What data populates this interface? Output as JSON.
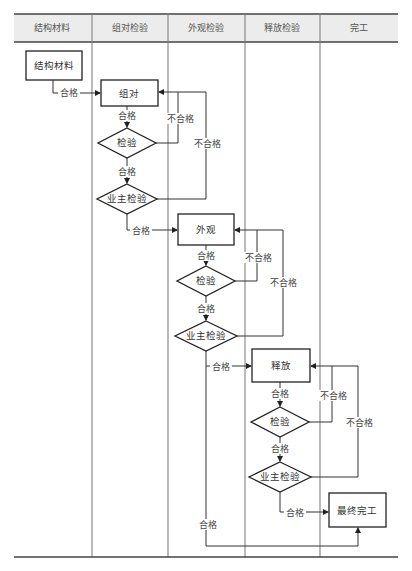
{
  "diagram": {
    "type": "swimlane-flowchart",
    "lanes": [
      {
        "id": "lane-material",
        "label": "结构材料"
      },
      {
        "id": "lane-assembly",
        "label": "组对检验"
      },
      {
        "id": "lane-appearance",
        "label": "外观检验"
      },
      {
        "id": "lane-release",
        "label": "释放检验"
      },
      {
        "id": "lane-completion",
        "label": "完工"
      }
    ],
    "nodes": {
      "material": {
        "label": "结构材料",
        "shape": "rect",
        "lane": "lane-material"
      },
      "assembly": {
        "label": "组对",
        "shape": "rect",
        "lane": "lane-assembly"
      },
      "assembly_check": {
        "label": "检验",
        "shape": "diamond",
        "lane": "lane-assembly"
      },
      "assembly_owner": {
        "label": "业主检验",
        "shape": "diamond",
        "lane": "lane-assembly"
      },
      "appearance": {
        "label": "外观",
        "shape": "rect",
        "lane": "lane-appearance"
      },
      "appearance_check": {
        "label": "检验",
        "shape": "diamond",
        "lane": "lane-appearance"
      },
      "appearance_owner": {
        "label": "业主检验",
        "shape": "diamond",
        "lane": "lane-appearance"
      },
      "release": {
        "label": "释放",
        "shape": "rect",
        "lane": "lane-release"
      },
      "release_check": {
        "label": "检验",
        "shape": "diamond",
        "lane": "lane-release"
      },
      "release_owner": {
        "label": "业主检验",
        "shape": "diamond",
        "lane": "lane-release"
      },
      "final": {
        "label": "最终完工",
        "shape": "rect",
        "lane": "lane-completion"
      }
    },
    "edge_labels": {
      "pass": "合格",
      "fail": "不合格"
    },
    "edges": [
      {
        "from": "material",
        "to": "assembly",
        "label": "合格"
      },
      {
        "from": "assembly",
        "to": "assembly_check",
        "label": "合格"
      },
      {
        "from": "assembly_check",
        "to": "assembly_owner",
        "label": "合格"
      },
      {
        "from": "assembly_check",
        "to": "assembly",
        "label": "不合格"
      },
      {
        "from": "assembly_owner",
        "to": "assembly",
        "label": "不合格"
      },
      {
        "from": "assembly_owner",
        "to": "appearance",
        "label": "合格"
      },
      {
        "from": "appearance",
        "to": "appearance_check",
        "label": "合格"
      },
      {
        "from": "appearance_check",
        "to": "appearance_owner",
        "label": "合格"
      },
      {
        "from": "appearance_check",
        "to": "appearance",
        "label": "不合格"
      },
      {
        "from": "appearance_owner",
        "to": "appearance",
        "label": "不合格"
      },
      {
        "from": "appearance_owner",
        "to": "release",
        "label": "合格"
      },
      {
        "from": "appearance_owner",
        "to": "final",
        "label": "合格"
      },
      {
        "from": "release",
        "to": "release_check",
        "label": "合格"
      },
      {
        "from": "release_check",
        "to": "release_owner",
        "label": "合格"
      },
      {
        "from": "release_check",
        "to": "release",
        "label": "不合格"
      },
      {
        "from": "release_owner",
        "to": "release",
        "label": "不合格"
      },
      {
        "from": "release_owner",
        "to": "final",
        "label": "合格"
      }
    ],
    "colors": {
      "header_bg": "#ececec",
      "line": "#333333",
      "lane_divider": "#777777"
    }
  }
}
